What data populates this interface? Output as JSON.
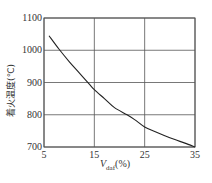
{
  "chart_data": {
    "type": "line",
    "title": "",
    "xlabel": "V_daf(%)",
    "xlabel_main": "V",
    "xlabel_sub": "daf",
    "xlabel_unit": "(%)",
    "ylabel": "着火温度(℃)",
    "xlim": [
      5,
      35
    ],
    "ylim": [
      700,
      1100
    ],
    "xticks": [
      5,
      15,
      25,
      35
    ],
    "yticks": [
      700,
      800,
      900,
      1000,
      1100
    ],
    "grid": true,
    "legend": null,
    "series": [
      {
        "name": "着火温度",
        "x": [
          6,
          8,
          10,
          12,
          14,
          15,
          17,
          19,
          21.5,
          23,
          25,
          27,
          29,
          31,
          33,
          35
        ],
        "y": [
          1045,
          1003,
          965,
          930,
          895,
          878,
          850,
          822,
          800,
          785,
          762,
          748,
          735,
          723,
          712,
          700
        ]
      }
    ],
    "colors": {
      "line": "#222222",
      "grid": "#555555",
      "axis": "#555555"
    }
  }
}
